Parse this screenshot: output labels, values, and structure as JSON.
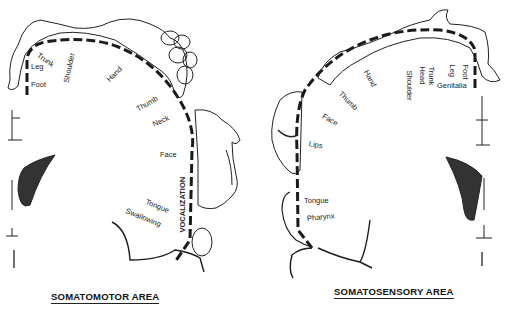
{
  "left_panel": {
    "title": "SOMATOMOTOR AREA",
    "labels": {
      "trunk": "Trunk",
      "leg": "Leg",
      "foot": "Foot",
      "shoulder": "Shoulder",
      "hand": "Hand",
      "thumb": "Thumb",
      "neck": "Neck",
      "face": "Face",
      "vocalization": "VOCALIZATION",
      "tongue": "Tongue",
      "swallowing": "Swallowing"
    }
  },
  "right_panel": {
    "title": "SOMATOSENSORY AREA",
    "labels": {
      "foot": "Foot",
      "leg": "Leg",
      "trunk": "Trunk",
      "head": "Head",
      "shoulder": "Shoulder",
      "hand": "Hand",
      "thumb": "Thumb",
      "face": "Face",
      "lips": "Lips",
      "genitalia": "Genitalia",
      "tongue": "Tongue",
      "pharynx": "Pharynx"
    }
  },
  "colors": {
    "ink": "#1a1a1a",
    "background": "#ffffff"
  }
}
